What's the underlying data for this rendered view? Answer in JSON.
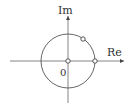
{
  "diagram": {
    "type": "complex-plane",
    "axes": {
      "real_label": "Re",
      "imag_label": "Im",
      "origin_label": "0"
    },
    "unit_circle": true,
    "points": [
      {
        "name": "origin",
        "re": 0,
        "im": 0
      },
      {
        "name": "one",
        "re": 1,
        "im": 0
      },
      {
        "name": "point-on-circle",
        "re": 0.55,
        "im": 0.83
      }
    ],
    "colors": {
      "stroke": "#555555",
      "background": "#ffffff"
    }
  }
}
